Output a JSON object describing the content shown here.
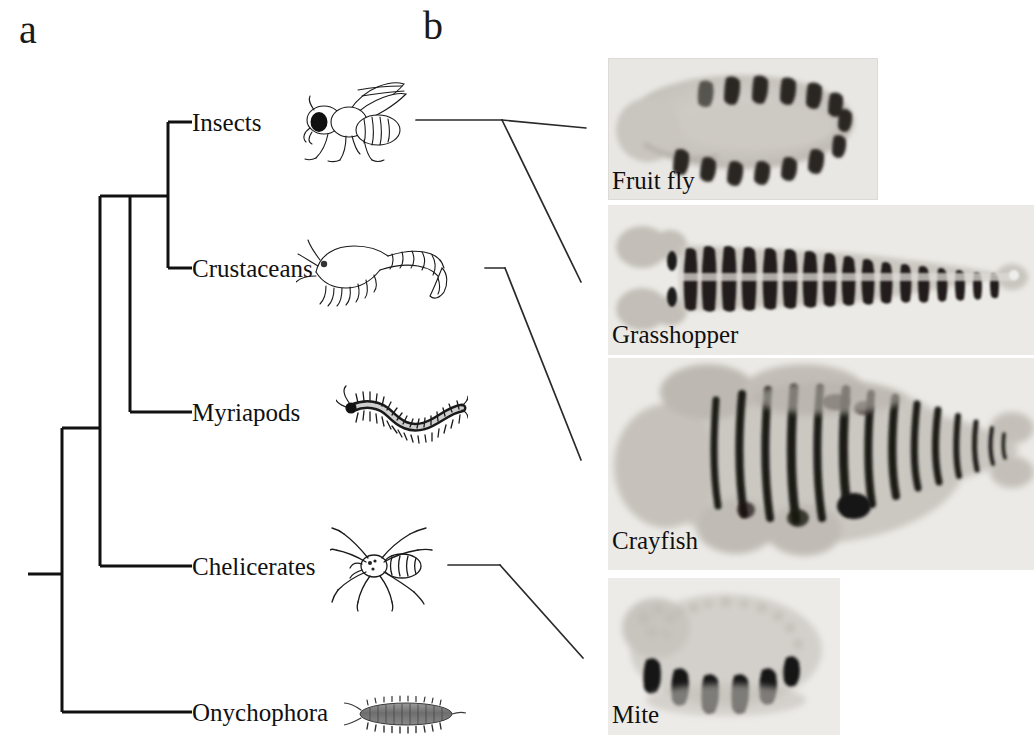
{
  "figure": {
    "panels": {
      "a_letter": "a",
      "b_letter": "b"
    }
  },
  "cladogram": {
    "taxa": [
      {
        "id": "insects",
        "label": "Insects",
        "y": 122,
        "art": "fly"
      },
      {
        "id": "crustaceans",
        "label": "Crustaceans",
        "y": 268,
        "art": "shrimp"
      },
      {
        "id": "myriapods",
        "label": "Myriapods",
        "y": 412,
        "art": "centipede"
      },
      {
        "id": "chelicerates",
        "label": "Chelicerates",
        "y": 566,
        "art": "spider"
      },
      {
        "id": "onychophora",
        "label": "Onychophora",
        "y": 712,
        "art": "velvetworm"
      }
    ],
    "line_color": "#111111",
    "line_width": 3
  },
  "micrographs": [
    {
      "id": "fruitfly",
      "caption": "Fruit fly",
      "stripes": 11,
      "organism": "Drosophila melanogaster"
    },
    {
      "id": "grasshopper",
      "caption": "Grasshopper",
      "stripes": 16,
      "organism": "Schistocerca"
    },
    {
      "id": "crayfish",
      "caption": "Crayfish",
      "stripes": 14,
      "organism": "Procambarus"
    },
    {
      "id": "mite",
      "caption": "Mite",
      "stripes": 6,
      "organism": "Acari"
    }
  ],
  "connector_color": "#2a2a2a"
}
